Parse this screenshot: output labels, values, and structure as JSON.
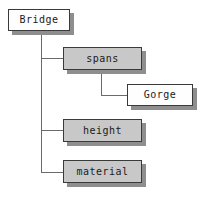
{
  "diagram": {
    "type": "tree",
    "canvas": {
      "width": 205,
      "height": 199,
      "background": "#ffffff"
    },
    "styles": {
      "root_fill": "#fefefe",
      "branch_fill": "#c8c8c8",
      "leaf_fill": "#fefefe",
      "border_color": "#3a3a3a",
      "shadow_color": "#8e8e8e",
      "line_color": "#6b6b6b",
      "text_color": "#1a1a1a"
    },
    "nodes": [
      {
        "id": "bridge",
        "label": "Bridge",
        "fill": "white",
        "level": 0,
        "x": 8,
        "y": 9,
        "w": 62,
        "h": 22
      },
      {
        "id": "spans",
        "label": "spans",
        "fill": "gray",
        "level": 1,
        "x": 63,
        "y": 47,
        "w": 79,
        "h": 23
      },
      {
        "id": "gorge",
        "label": "Gorge",
        "fill": "white",
        "level": 2,
        "x": 127,
        "y": 84,
        "w": 66,
        "h": 22
      },
      {
        "id": "height",
        "label": "height",
        "fill": "gray",
        "level": 1,
        "x": 63,
        "y": 119,
        "w": 79,
        "h": 23
      },
      {
        "id": "material",
        "label": "material",
        "fill": "gray",
        "level": 1,
        "x": 63,
        "y": 160,
        "w": 79,
        "h": 23
      }
    ],
    "edges": [
      {
        "from": "bridge",
        "to": "spans"
      },
      {
        "from": "bridge",
        "to": "height"
      },
      {
        "from": "bridge",
        "to": "material"
      },
      {
        "from": "spans",
        "to": "gorge"
      }
    ]
  }
}
